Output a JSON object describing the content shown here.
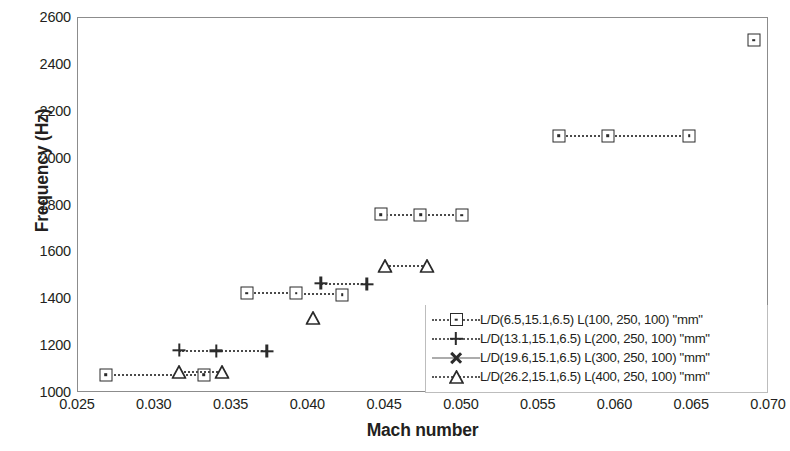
{
  "chart_data": {
    "type": "scatter",
    "title": "",
    "xlabel": "Mach number",
    "ylabel": "Frequency (Hz)",
    "xlim": [
      0.025,
      0.07
    ],
    "ylim": [
      1000,
      2600
    ],
    "xticks": [
      "0.025",
      "0.030",
      "0.035",
      "0.040",
      "0.045",
      "0.050",
      "0.055",
      "0.060",
      "0.065",
      "0.070"
    ],
    "yticks": [
      "1000",
      "1200",
      "1400",
      "1600",
      "1800",
      "2000",
      "2200",
      "2400",
      "2600"
    ],
    "grid": false,
    "legend_position": "inside-bottom-right",
    "series": [
      {
        "name": "L/D(6.5,15.1,6.5)  L(100, 250, 100) \"mm\"",
        "marker": "square",
        "line": "dotted",
        "color": "#2b2b2b",
        "points": [
          {
            "x": 0.0268,
            "y": 1078
          },
          {
            "x": 0.0332,
            "y": 1078
          },
          {
            "x": 0.036,
            "y": 1425
          },
          {
            "x": 0.0392,
            "y": 1425
          },
          {
            "x": 0.0422,
            "y": 1420
          },
          {
            "x": 0.0447,
            "y": 1762
          },
          {
            "x": 0.0473,
            "y": 1760
          },
          {
            "x": 0.05,
            "y": 1758
          },
          {
            "x": 0.0563,
            "y": 2098
          },
          {
            "x": 0.0595,
            "y": 2098
          },
          {
            "x": 0.0648,
            "y": 2098
          },
          {
            "x": 0.069,
            "y": 2505
          }
        ]
      },
      {
        "name": "L/D(13.1,15.1,6.5) L(200, 250, 100) \"mm\"",
        "marker": "plus",
        "line": "dotted",
        "color": "#2b2b2b",
        "points": [
          {
            "x": 0.0316,
            "y": 1182
          },
          {
            "x": 0.034,
            "y": 1180
          },
          {
            "x": 0.0373,
            "y": 1178
          },
          {
            "x": 0.0408,
            "y": 1468
          },
          {
            "x": 0.0438,
            "y": 1465
          }
        ]
      },
      {
        "name": "L/D(19.6,15.1,6.5) L(300, 250, 100) \"mm\"",
        "marker": "star",
        "line": "solid",
        "color": "#2b2b2b",
        "points": []
      },
      {
        "name": "L/D(26.2,15.1,6.5) L(400, 250, 100) \"mm\"",
        "marker": "triangle",
        "line": "dotted",
        "color": "#2b2b2b",
        "points": [
          {
            "x": 0.0316,
            "y": 1090
          },
          {
            "x": 0.0344,
            "y": 1088
          },
          {
            "x": 0.0403,
            "y": 1320
          },
          {
            "x": 0.045,
            "y": 1542
          },
          {
            "x": 0.0477,
            "y": 1540
          }
        ]
      }
    ]
  }
}
